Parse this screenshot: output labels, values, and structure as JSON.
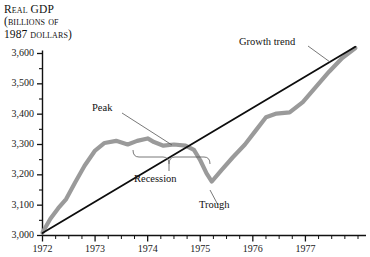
{
  "chart_data": {
    "type": "line",
    "title": "Real GDP (billions of 1987 dollars)",
    "title_lines": [
      "Real GDP",
      "(billions of",
      "1987 dollars)"
    ],
    "xlabel": "",
    "ylabel": "Real GDP (billions of 1987 dollars)",
    "ylim": [
      3000,
      3650
    ],
    "xlim": [
      1972.0,
      1978.0
    ],
    "yticks": [
      3000,
      3100,
      3200,
      3300,
      3400,
      3500,
      3600
    ],
    "ytick_labels": [
      "3,000",
      "3,100",
      "3,200",
      "3,300",
      "3,400",
      "3,500",
      "3,600"
    ],
    "yminor_step": 50,
    "xticks": [
      1972,
      1973,
      1974,
      1975,
      1976,
      1977
    ],
    "xtick_labels": [
      "1972",
      "1973",
      "1974",
      "1975",
      "1976",
      "1977"
    ],
    "xminor_step": 0.25,
    "grid": false,
    "legend": "none",
    "series": [
      {
        "name": "Real GDP",
        "color": "#9a9a9a",
        "width": 4.2,
        "points": [
          [
            1972.0,
            3010
          ],
          [
            1972.15,
            3055
          ],
          [
            1972.3,
            3090
          ],
          [
            1972.45,
            3120
          ],
          [
            1972.62,
            3175
          ],
          [
            1972.8,
            3230
          ],
          [
            1973.0,
            3280
          ],
          [
            1973.18,
            3305
          ],
          [
            1973.4,
            3312
          ],
          [
            1973.62,
            3300
          ],
          [
            1973.8,
            3312
          ],
          [
            1974.0,
            3320
          ],
          [
            1974.12,
            3308
          ],
          [
            1974.3,
            3296
          ],
          [
            1974.5,
            3300
          ],
          [
            1974.72,
            3296
          ],
          [
            1974.88,
            3282
          ],
          [
            1975.0,
            3248
          ],
          [
            1975.12,
            3205
          ],
          [
            1975.22,
            3178
          ],
          [
            1975.4,
            3215
          ],
          [
            1975.62,
            3258
          ],
          [
            1975.85,
            3300
          ],
          [
            1976.05,
            3345
          ],
          [
            1976.25,
            3390
          ],
          [
            1976.45,
            3402
          ],
          [
            1976.7,
            3406
          ],
          [
            1976.95,
            3440
          ],
          [
            1977.2,
            3490
          ],
          [
            1977.45,
            3540
          ],
          [
            1977.7,
            3585
          ],
          [
            1977.95,
            3618
          ]
        ]
      },
      {
        "name": "Growth trend",
        "color": "#0d0d0d",
        "width": 1.8,
        "points": [
          [
            1972.0,
            3008
          ],
          [
            1977.95,
            3622
          ]
        ]
      }
    ],
    "annotations": [
      {
        "label": "Peak",
        "anchor_x": 1974.02,
        "anchor_y": 3322
      },
      {
        "label": "Recession",
        "anchor_x": 1974.55,
        "anchor_y": 3258
      },
      {
        "label": "Trough",
        "anchor_x": 1975.24,
        "anchor_y": 3175
      },
      {
        "label": "Growth trend",
        "anchor_x": 1977.05,
        "anchor_y": 3500
      }
    ]
  },
  "labels": {
    "peak": "Peak",
    "recession": "Recession",
    "trough": "Trough",
    "growth_trend": "Growth trend"
  }
}
